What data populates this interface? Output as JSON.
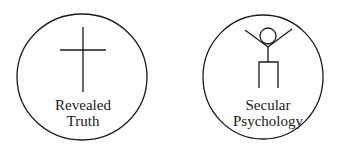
{
  "diagram": {
    "circles": [
      {
        "id": "revealed-truth",
        "icon": "cross-icon",
        "label_lines": [
          "Revealed",
          "Truth"
        ]
      },
      {
        "id": "secular-psychology",
        "icon": "stick-figure-icon",
        "label_lines": [
          "Secular",
          "Psychology"
        ]
      }
    ],
    "colors": {
      "stroke": "#1a1a1a",
      "background": "#ffffff"
    }
  }
}
